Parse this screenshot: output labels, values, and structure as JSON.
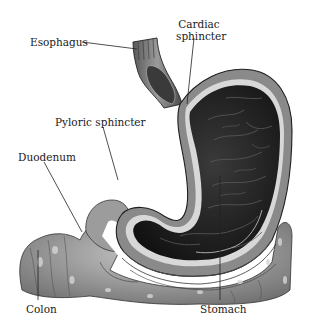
{
  "figure": {
    "labels": {
      "esophagus": "Esophagus",
      "cardiac_line1": "Cardiac",
      "cardiac_line2": "sphincter",
      "pyloric": "Pyloric sphincter",
      "duodenum": "Duodenum",
      "colon": "Colon",
      "stomach": "Stomach"
    },
    "colors": {
      "background": "#ffffff",
      "stomach_interior": "#1e1e1e",
      "stomach_wall": "#8a8a8a",
      "colon": "#a8a8a8",
      "leader_line": "#222222",
      "label_text": "#1a1a1a"
    }
  }
}
